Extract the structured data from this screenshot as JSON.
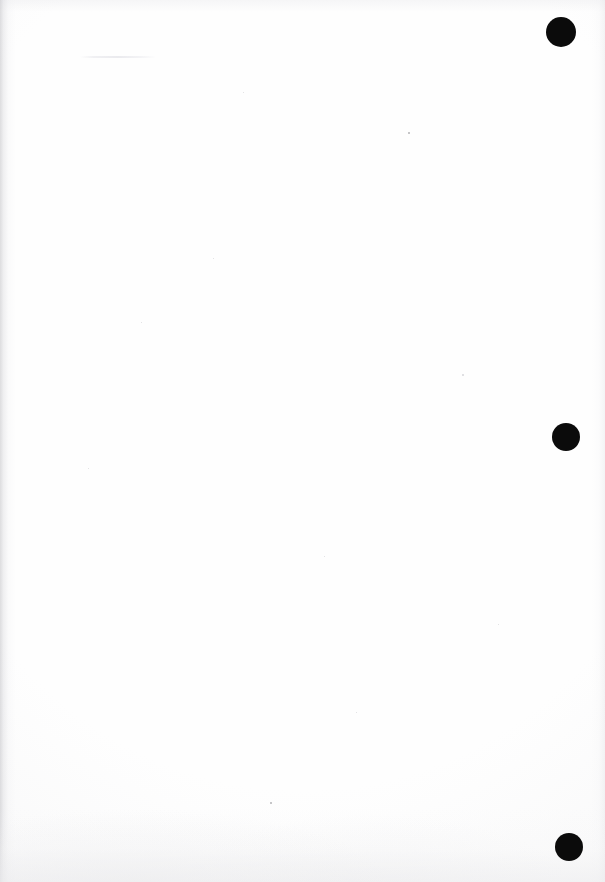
{
  "document": {
    "kind": "scanned-page",
    "content_text": "",
    "page_note": "Blank scanned page",
    "width_px": 605,
    "height_px": 882,
    "background_color": "#fefefe"
  },
  "marks": {
    "color": "#0b0b0b",
    "label": "registration mark",
    "items": [
      {
        "name": "registration-mark-top",
        "cx": 561,
        "cy": 32,
        "r": 15
      },
      {
        "name": "registration-mark-middle",
        "cx": 566,
        "cy": 437,
        "r": 14
      },
      {
        "name": "registration-mark-bottom",
        "cx": 569,
        "cy": 847,
        "r": 14
      }
    ]
  },
  "artifacts": {
    "label": "scanner noise",
    "specks": [
      {
        "x": 408,
        "y": 132,
        "size": 2.2,
        "faint": false
      },
      {
        "x": 270,
        "y": 802,
        "size": 2.0,
        "faint": false
      },
      {
        "x": 462,
        "y": 374,
        "size": 1.6,
        "faint": true
      },
      {
        "x": 213,
        "y": 258,
        "size": 1.3,
        "faint": true
      },
      {
        "x": 324,
        "y": 556,
        "size": 1.3,
        "faint": true
      },
      {
        "x": 141,
        "y": 322,
        "size": 1.2,
        "faint": true
      },
      {
        "x": 498,
        "y": 624,
        "size": 1.2,
        "faint": true
      },
      {
        "x": 88,
        "y": 468,
        "size": 1.1,
        "faint": true
      },
      {
        "x": 356,
        "y": 712,
        "size": 1.1,
        "faint": true
      },
      {
        "x": 243,
        "y": 92,
        "size": 1.1,
        "faint": true
      }
    ],
    "streak": {
      "x": 80,
      "y": 56,
      "width": 76,
      "height": 2
    }
  }
}
